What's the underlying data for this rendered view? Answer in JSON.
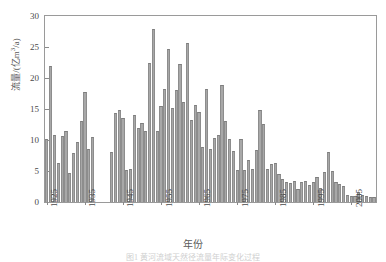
{
  "figure": {
    "xlabel": "年份",
    "ylabel_main": "流量/(亿m",
    "ylabel_sup": "3",
    "ylabel_tail": "/a)",
    "caption": "图1  黄河流域天然径流量年际变化过程",
    "bar_color": "#a8a8a8",
    "axis_color": "#9a9a9a"
  },
  "chart_data": {
    "type": "bar",
    "title": "",
    "xlabel": "年份",
    "ylabel": "流量/(亿m³/a)",
    "ylim": [
      0,
      30
    ],
    "yticks": [
      0,
      5,
      10,
      15,
      20,
      25,
      30
    ],
    "xticks": [
      1925,
      1935,
      1945,
      1955,
      1965,
      1975,
      1985,
      1995,
      2005
    ],
    "xlim": [
      1924.5,
      2011.5
    ],
    "grid": false,
    "legend": null,
    "categories": [
      1925,
      1926,
      1927,
      1928,
      1929,
      1930,
      1931,
      1932,
      1933,
      1934,
      1935,
      1936,
      1937,
      1942,
      1943,
      1944,
      1945,
      1946,
      1947,
      1948,
      1949,
      1950,
      1951,
      1952,
      1953,
      1954,
      1955,
      1956,
      1957,
      1958,
      1959,
      1960,
      1961,
      1962,
      1963,
      1964,
      1965,
      1966,
      1967,
      1968,
      1969,
      1970,
      1971,
      1972,
      1973,
      1974,
      1975,
      1976,
      1977,
      1978,
      1979,
      1980,
      1981,
      1982,
      1983,
      1984,
      1985,
      1986,
      1987,
      1988,
      1989,
      1990,
      1991,
      1992,
      1993,
      1994,
      1995,
      1996,
      1997,
      1998,
      1999,
      2000,
      2001,
      2002,
      2003,
      2004,
      2005,
      2006,
      2007,
      2008,
      2009,
      2010,
      2011
    ],
    "values": [
      10.1,
      21.9,
      10.8,
      6.3,
      10.6,
      11.4,
      4.7,
      7.9,
      9.6,
      13.1,
      17.8,
      8.5,
      10.5,
      8.1,
      14.4,
      14.8,
      13.5,
      5.2,
      5.3,
      14.0,
      12.0,
      12.8,
      11.4,
      22.5,
      27.9,
      11.5,
      15.5,
      18.2,
      24.6,
      15.1,
      18.0,
      22.3,
      16.2,
      25.6,
      13.2,
      15.7,
      14.5,
      8.8,
      18.2,
      8.6,
      10.4,
      10.8,
      18.8,
      13.1,
      10.1,
      8.2,
      5.1,
      10.1,
      5.2,
      6.7,
      5.3,
      8.4,
      14.9,
      12.6,
      5.3,
      6.2,
      6.3,
      4.5,
      3.7,
      3.2,
      3.0,
      3.4,
      2.1,
      3.2,
      3.4,
      2.8,
      3.3,
      4.0,
      2.2,
      4.8,
      8.1,
      5.0,
      3.2,
      2.9,
      2.6,
      1.2,
      0.9,
      1.0,
      1.6,
      1.2,
      0.9,
      0.8,
      0.8
    ]
  }
}
